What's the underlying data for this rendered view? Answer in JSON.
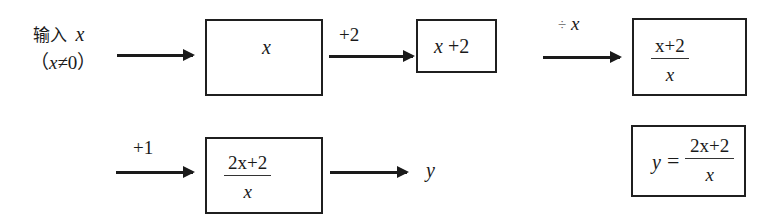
{
  "input": {
    "label_cn": "输入",
    "var": "x",
    "condition_open": "（",
    "condition_var": "x",
    "condition_rest": "≠0",
    "condition_close": "）"
  },
  "steps": [
    {
      "op": "",
      "box": {
        "text": "x"
      }
    },
    {
      "op": "+2",
      "box": {
        "var": "x",
        "rest": " +2"
      }
    },
    {
      "op_symbol": "÷",
      "op_var": "x",
      "box": {
        "numerator": "x+2",
        "denominator": "x"
      }
    },
    {
      "op": "+1",
      "box": {
        "numerator": "2x+2",
        "denominator": "x"
      }
    }
  ],
  "output": {
    "var": "y"
  },
  "result": {
    "lhs": "y",
    "eq": "=",
    "numerator": "2x+2",
    "denominator": "x"
  },
  "colors": {
    "stroke": "#1f1f1f",
    "background": "#ffffff"
  }
}
